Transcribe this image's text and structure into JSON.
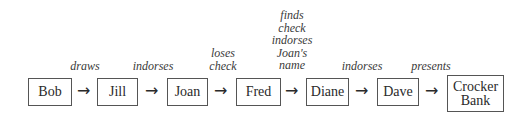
{
  "diagram": {
    "type": "flow",
    "nodes": [
      {
        "id": "bob",
        "label": "Bob"
      },
      {
        "id": "jill",
        "label": "Jill"
      },
      {
        "id": "joan",
        "label": "Joan"
      },
      {
        "id": "fred",
        "label": "Fred"
      },
      {
        "id": "diane",
        "label": "Diane"
      },
      {
        "id": "dave",
        "label": "Dave"
      },
      {
        "id": "crocker_bank",
        "label_line1": "Crocker",
        "label_line2": "Bank"
      }
    ],
    "edges": [
      {
        "from": "bob",
        "to": "jill",
        "label_lines": [
          "draws"
        ]
      },
      {
        "from": "jill",
        "to": "joan",
        "label_lines": [
          "indorses"
        ]
      },
      {
        "from": "joan",
        "to": "fred",
        "label_lines": [
          "loses",
          "check"
        ]
      },
      {
        "from": "fred",
        "to": "diane",
        "label_lines": [
          "finds",
          "check",
          "indorses",
          "Joan's",
          "name"
        ]
      },
      {
        "from": "diane",
        "to": "dave",
        "label_lines": [
          "indorses"
        ]
      },
      {
        "from": "dave",
        "to": "crocker_bank",
        "label_lines": [
          "presents"
        ]
      }
    ],
    "arrow_glyph": "→"
  }
}
